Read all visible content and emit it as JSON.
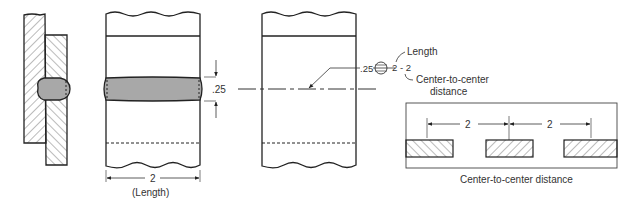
{
  "diagram": {
    "type": "plug-slot-weld-drawing",
    "colors": {
      "line": "#222222",
      "weld_fill": "#a8a8a8",
      "hatch": "#555555",
      "background": "#ffffff"
    },
    "views": {
      "section_view": {
        "label": ""
      },
      "plan_view": {
        "dimension_thickness": ".25",
        "dimension_length": "2",
        "dimension_length_caption": "(Length)"
      },
      "symbol_view": {
        "weld_size": ".25",
        "length_pitch": "2 - 2"
      },
      "callouts": {
        "length": "Length",
        "center_to_center_line1": "Center-to-center",
        "center_to_center_line2": "distance"
      },
      "pitch_detail": {
        "pitch_left": "2",
        "pitch_right": "2",
        "caption": "Center-to-center distance"
      }
    }
  }
}
